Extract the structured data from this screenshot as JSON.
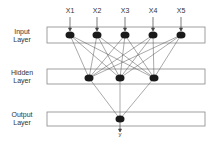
{
  "diagram": {
    "type": "neural-network-architecture",
    "layers": [
      {
        "name": "Input Layer",
        "line1": "Input",
        "line2": "Layer",
        "nodes": 5
      },
      {
        "name": "Hidden Layer",
        "line1": "Hidden",
        "line2": "Layer",
        "nodes": 3
      },
      {
        "name": "Output Layer",
        "line1": "Output",
        "line2": "Layer",
        "nodes": 1
      }
    ],
    "inputs": [
      "X1",
      "X2",
      "X3",
      "X4",
      "X5"
    ],
    "output": "y",
    "colors": {
      "node": "#1a1a1a",
      "edge": "#555555",
      "box": "#888888"
    }
  }
}
